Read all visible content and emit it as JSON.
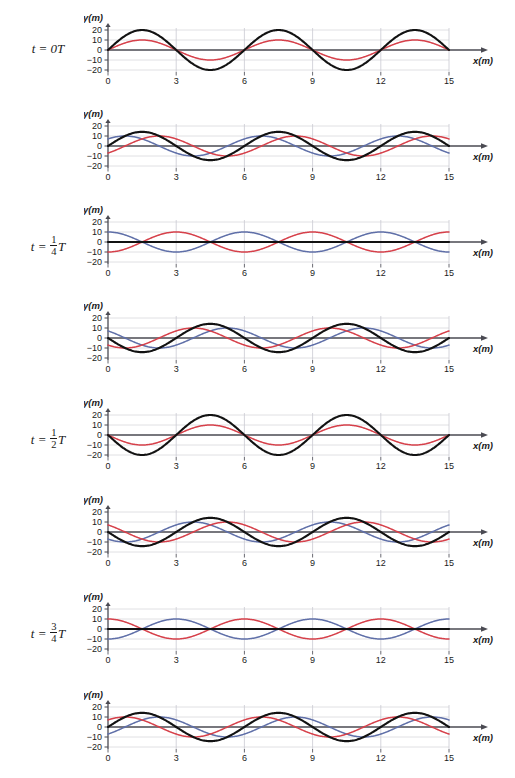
{
  "figure": {
    "axis": {
      "xlabel": "x(m)",
      "ylabel": "y(m)",
      "xticks": [
        "0",
        "3",
        "6",
        "9",
        "12",
        "15"
      ],
      "xtick_values": [
        0,
        3,
        6,
        9,
        12,
        15
      ],
      "yticks": [
        "20",
        "10",
        "0",
        "−10",
        "−20"
      ],
      "ytick_values": [
        20,
        10,
        0,
        -10,
        -20
      ],
      "xlim": [
        0,
        15
      ],
      "ylim": [
        -24,
        24
      ],
      "grid": true
    },
    "colors": {
      "wave_right": "#d6404a",
      "wave_left": "#5f6fa8",
      "sum": "#121212",
      "axis": "#4a4a52",
      "grid": "#d8d8dc",
      "text": "#1b1b1b"
    },
    "legend": {
      "wave_right_name": "wave moving right (red)",
      "wave_left_name": "wave moving left (blue)",
      "sum_name": "resultant superposition (black)"
    }
  },
  "chart_data": {
    "type": "line",
    "xlabel": "x(m)",
    "ylabel": "y(m)",
    "xlim": [
      0,
      15
    ],
    "ylim": [
      -24,
      24
    ],
    "grid": true,
    "wave_parameters": {
      "amplitude": 10,
      "wavelength": 6,
      "wavenumber_k": 1.0471975512,
      "units": "m",
      "sum_max_amplitude": 20
    },
    "panels": [
      {
        "index": 0,
        "time_label": "t = 0T",
        "time_fraction": 0,
        "phase_deg": 0,
        "series": [
          {
            "name": "wave_right",
            "color": "#d6404a",
            "amplitude": 10,
            "phase_deg": 0,
            "visible": true
          },
          {
            "name": "wave_left",
            "color": "#5f6fa8",
            "amplitude": 10,
            "phase_deg": 0,
            "visible": false
          },
          {
            "name": "sum",
            "color": "#121212",
            "amplitude": 20,
            "phase_deg": 0,
            "visible": true
          }
        ]
      },
      {
        "index": 1,
        "time_label": "",
        "time_fraction": 0.125,
        "phase_deg": 45,
        "series": [
          {
            "name": "wave_right",
            "color": "#d6404a",
            "amplitude": 10,
            "phase_deg": -45,
            "visible": true
          },
          {
            "name": "wave_left",
            "color": "#5f6fa8",
            "amplitude": 10,
            "phase_deg": 45,
            "visible": true
          },
          {
            "name": "sum",
            "color": "#121212",
            "amplitude": 14.14,
            "phase_deg": 0,
            "visible": true
          }
        ]
      },
      {
        "index": 2,
        "time_label": "t = 1/4 T",
        "time_fraction": 0.25,
        "phase_deg": 90,
        "series": [
          {
            "name": "wave_right",
            "color": "#d6404a",
            "amplitude": 10,
            "phase_deg": -90,
            "visible": true
          },
          {
            "name": "wave_left",
            "color": "#5f6fa8",
            "amplitude": 10,
            "phase_deg": 90,
            "visible": true
          },
          {
            "name": "sum",
            "color": "#121212",
            "amplitude": 0,
            "phase_deg": 0,
            "visible": true
          }
        ]
      },
      {
        "index": 3,
        "time_label": "",
        "time_fraction": 0.375,
        "phase_deg": 135,
        "series": [
          {
            "name": "wave_right",
            "color": "#d6404a",
            "amplitude": 10,
            "phase_deg": -135,
            "visible": true
          },
          {
            "name": "wave_left",
            "color": "#5f6fa8",
            "amplitude": 10,
            "phase_deg": 135,
            "visible": true
          },
          {
            "name": "sum",
            "color": "#121212",
            "amplitude": -14.14,
            "phase_deg": 0,
            "visible": true
          }
        ]
      },
      {
        "index": 4,
        "time_label": "t = 1/2 T",
        "time_fraction": 0.5,
        "phase_deg": 180,
        "series": [
          {
            "name": "wave_right",
            "color": "#d6404a",
            "amplitude": -10,
            "phase_deg": 180,
            "visible": true
          },
          {
            "name": "wave_left",
            "color": "#5f6fa8",
            "amplitude": -10,
            "phase_deg": 180,
            "visible": false
          },
          {
            "name": "sum",
            "color": "#121212",
            "amplitude": -20,
            "phase_deg": 180,
            "visible": true
          }
        ]
      },
      {
        "index": 5,
        "time_label": "",
        "time_fraction": 0.625,
        "phase_deg": 225,
        "series": [
          {
            "name": "wave_right",
            "color": "#d6404a",
            "amplitude": 10,
            "phase_deg": -225,
            "visible": true
          },
          {
            "name": "wave_left",
            "color": "#5f6fa8",
            "amplitude": 10,
            "phase_deg": 225,
            "visible": true
          },
          {
            "name": "sum",
            "color": "#121212",
            "amplitude": -14.14,
            "phase_deg": 0,
            "visible": true
          }
        ]
      },
      {
        "index": 6,
        "time_label": "t = 3/4 T",
        "time_fraction": 0.75,
        "phase_deg": 270,
        "series": [
          {
            "name": "wave_right",
            "color": "#d6404a",
            "amplitude": 10,
            "phase_deg": -270,
            "visible": true
          },
          {
            "name": "wave_left",
            "color": "#5f6fa8",
            "amplitude": 10,
            "phase_deg": 270,
            "visible": true
          },
          {
            "name": "sum",
            "color": "#121212",
            "amplitude": 0,
            "phase_deg": 0,
            "visible": true
          }
        ]
      },
      {
        "index": 7,
        "time_label": "",
        "time_fraction": 0.875,
        "phase_deg": 315,
        "series": [
          {
            "name": "wave_right",
            "color": "#d6404a",
            "amplitude": 10,
            "phase_deg": -315,
            "visible": true
          },
          {
            "name": "wave_left",
            "color": "#5f6fa8",
            "amplitude": 10,
            "phase_deg": 315,
            "visible": true
          },
          {
            "name": "sum",
            "color": "#121212",
            "amplitude": 14.14,
            "phase_deg": 0,
            "visible": true
          }
        ]
      }
    ]
  },
  "time_labels": {
    "t0": "t = 0T",
    "t_quarter_lhs": "t =",
    "t_quarter_num": "1",
    "t_quarter_den": "4",
    "t_quarter_T": "T",
    "t_half_num": "1",
    "t_half_den": "2",
    "t_half_T": "T",
    "t_threequarter_num": "3",
    "t_threequarter_den": "4",
    "t_threequarter_T": "T"
  }
}
